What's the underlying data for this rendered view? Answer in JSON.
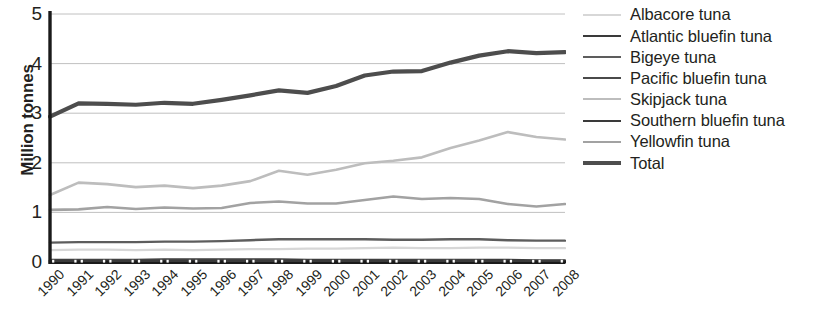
{
  "chart_data": {
    "type": "line",
    "title": "",
    "xlabel": "",
    "ylabel": "Million tonnes",
    "ylim": [
      0,
      5
    ],
    "yticks": [
      0,
      1,
      2,
      3,
      4,
      5
    ],
    "ytick_labels": [
      "0",
      "1",
      "2",
      "3",
      "4",
      "5"
    ],
    "grid": true,
    "grid_axis": "y",
    "legend_position": "right",
    "x": [
      1990,
      1991,
      1992,
      1993,
      1994,
      1995,
      1996,
      1997,
      1998,
      1999,
      2000,
      2001,
      2002,
      2003,
      2004,
      2005,
      2006,
      2007,
      2008
    ],
    "categories": [
      "1990",
      "1991",
      "1992",
      "1993",
      "1994",
      "1995",
      "1996",
      "1997",
      "1998",
      "1999",
      "2000",
      "2001",
      "2002",
      "2003",
      "2004",
      "2005",
      "2006",
      "2007",
      "2008"
    ],
    "series": [
      {
        "name": "Albacore tuna",
        "color": "#d7d7d7",
        "width": 2.2,
        "values": [
          0.24,
          0.25,
          0.25,
          0.24,
          0.25,
          0.24,
          0.25,
          0.26,
          0.26,
          0.27,
          0.27,
          0.28,
          0.29,
          0.28,
          0.28,
          0.29,
          0.29,
          0.28,
          0.28
        ]
      },
      {
        "name": "Atlantic bluefin tuna",
        "color": "#3a3a3a",
        "width": 2.4,
        "values": [
          0.04,
          0.04,
          0.04,
          0.04,
          0.05,
          0.05,
          0.05,
          0.05,
          0.05,
          0.04,
          0.04,
          0.04,
          0.04,
          0.04,
          0.04,
          0.04,
          0.04,
          0.03,
          0.03
        ]
      },
      {
        "name": "Bigeye tuna",
        "color": "#5d5d5d",
        "width": 2.4,
        "values": [
          0.39,
          0.4,
          0.4,
          0.4,
          0.41,
          0.41,
          0.42,
          0.44,
          0.46,
          0.46,
          0.46,
          0.46,
          0.45,
          0.45,
          0.46,
          0.46,
          0.44,
          0.43,
          0.43
        ]
      },
      {
        "name": "Pacific bluefin tuna",
        "color": "#4a4a4a",
        "width": 2.4,
        "values": [
          0.03,
          0.03,
          0.03,
          0.03,
          0.03,
          0.03,
          0.03,
          0.03,
          0.03,
          0.02,
          0.02,
          0.02,
          0.03,
          0.03,
          0.03,
          0.02,
          0.02,
          0.02,
          0.02
        ]
      },
      {
        "name": "Skipjack tuna",
        "color": "#bdbdbd",
        "width": 2.6,
        "values": [
          1.35,
          1.6,
          1.57,
          1.51,
          1.54,
          1.49,
          1.54,
          1.63,
          1.84,
          1.76,
          1.86,
          1.99,
          2.04,
          2.11,
          2.3,
          2.45,
          2.62,
          2.52,
          2.47
        ]
      },
      {
        "name": "Southern bluefin tuna",
        "color": "#3a3a3a",
        "width": 2.4,
        "values": [
          0.02,
          0.02,
          0.02,
          0.02,
          0.02,
          0.02,
          0.02,
          0.02,
          0.02,
          0.02,
          0.02,
          0.02,
          0.02,
          0.02,
          0.02,
          0.02,
          0.02,
          0.01,
          0.01
        ]
      },
      {
        "name": "Yellowfin tuna",
        "color": "#a2a2a2",
        "width": 2.6,
        "values": [
          1.05,
          1.06,
          1.11,
          1.07,
          1.1,
          1.08,
          1.09,
          1.19,
          1.22,
          1.18,
          1.18,
          1.25,
          1.32,
          1.27,
          1.29,
          1.27,
          1.17,
          1.12,
          1.17
        ]
      },
      {
        "name": "Total",
        "color": "#4d4d4d",
        "width": 4.2,
        "values": [
          2.93,
          3.2,
          3.19,
          3.17,
          3.21,
          3.19,
          3.27,
          3.36,
          3.46,
          3.41,
          3.55,
          3.76,
          3.84,
          3.85,
          4.02,
          4.16,
          4.25,
          4.21,
          4.23
        ]
      }
    ]
  },
  "legend": {
    "items": [
      {
        "label": "Albacore tuna"
      },
      {
        "label": "Atlantic bluefin tuna"
      },
      {
        "label": "Bigeye tuna"
      },
      {
        "label": "Pacific bluefin tuna"
      },
      {
        "label": "Skipjack tuna"
      },
      {
        "label": "Southern bluefin tuna"
      },
      {
        "label": "Yellowfin tuna"
      },
      {
        "label": "Total"
      }
    ]
  },
  "axis": {
    "y_title": "Million tonnes"
  },
  "colors": {
    "axis_line": "#1a1a1a",
    "grid_line": "#b9b9b9",
    "text": "#231f20",
    "background": "#ffffff"
  }
}
